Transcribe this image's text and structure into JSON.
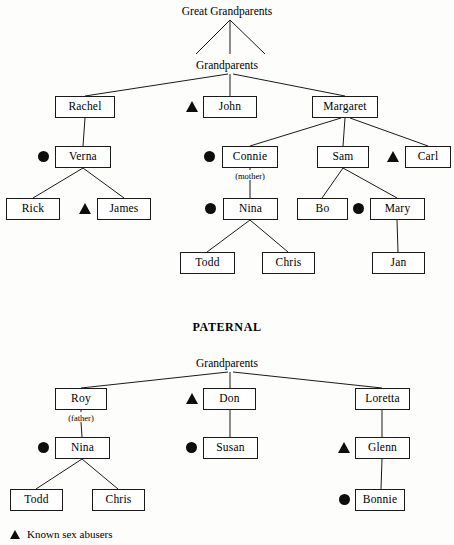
{
  "diagram": {
    "title_maternal": "Great Grandparents",
    "title_maternal_gp": "Grandparents",
    "title_paternal": "PATERNAL",
    "title_paternal_gp": "Grandparents",
    "line_color": "#1a1a1a",
    "marker_color": "#0d0d0d",
    "box_fill": "#ffffff"
  },
  "maternal": {
    "root_label": "Great Grandparents",
    "grandparents_label": "Grandparents",
    "nodes": [
      {
        "id": "rachel",
        "label": "Rachel",
        "x": 55,
        "y": 96,
        "w": 60,
        "h": 22,
        "marker": "none"
      },
      {
        "id": "john",
        "label": "John",
        "x": 203,
        "y": 96,
        "w": 54,
        "h": 22,
        "marker": "triangle"
      },
      {
        "id": "margaret",
        "label": "Margaret",
        "x": 312,
        "y": 96,
        "w": 66,
        "h": 22,
        "marker": "none"
      },
      {
        "id": "verna",
        "label": "Verna",
        "x": 55,
        "y": 146,
        "w": 56,
        "h": 22,
        "marker": "circle"
      },
      {
        "id": "connie",
        "label": "Connie",
        "x": 222,
        "y": 146,
        "w": 56,
        "h": 22,
        "marker": "circle"
      },
      {
        "id": "sam",
        "label": "Sam",
        "x": 317,
        "y": 146,
        "w": 52,
        "h": 22,
        "marker": "none"
      },
      {
        "id": "carl",
        "label": "Carl",
        "x": 405,
        "y": 146,
        "w": 46,
        "h": 22,
        "marker": "triangle"
      },
      {
        "id": "rick",
        "label": "Rick",
        "x": 6,
        "y": 198,
        "w": 54,
        "h": 22,
        "marker": "none"
      },
      {
        "id": "james",
        "label": "James",
        "x": 97,
        "y": 198,
        "w": 54,
        "h": 22,
        "marker": "triangle"
      },
      {
        "id": "nina_m",
        "label": "Nina",
        "x": 223,
        "y": 198,
        "w": 55,
        "h": 22,
        "marker": "circle"
      },
      {
        "id": "bo",
        "label": "Bo",
        "x": 297,
        "y": 198,
        "w": 51,
        "h": 22,
        "marker": "none"
      },
      {
        "id": "mary",
        "label": "Mary",
        "x": 370,
        "y": 198,
        "w": 55,
        "h": 22,
        "marker": "circle"
      },
      {
        "id": "todd_m",
        "label": "Todd",
        "x": 180,
        "y": 252,
        "w": 55,
        "h": 22,
        "marker": "none"
      },
      {
        "id": "chris_m",
        "label": "Chris",
        "x": 262,
        "y": 252,
        "w": 53,
        "h": 22,
        "marker": "none"
      },
      {
        "id": "jan",
        "label": "Jan",
        "x": 372,
        "y": 252,
        "w": 53,
        "h": 22,
        "marker": "none"
      }
    ],
    "sub_labels": [
      {
        "id": "connie-mother",
        "label": "(mother)",
        "x": 250,
        "y": 174
      }
    ]
  },
  "paternal": {
    "section_label": "PATERNAL",
    "grandparents_label": "Grandparents",
    "nodes": [
      {
        "id": "roy",
        "label": "Roy",
        "x": 55,
        "y": 388,
        "w": 52,
        "h": 22,
        "marker": "none"
      },
      {
        "id": "don",
        "label": "Don",
        "x": 203,
        "y": 388,
        "w": 53,
        "h": 22,
        "marker": "triangle"
      },
      {
        "id": "loretta",
        "label": "Loretta",
        "x": 355,
        "y": 388,
        "w": 55,
        "h": 22,
        "marker": "none"
      },
      {
        "id": "nina_p",
        "label": "Nina",
        "x": 55,
        "y": 437,
        "w": 55,
        "h": 22,
        "marker": "circle"
      },
      {
        "id": "susan",
        "label": "Susan",
        "x": 203,
        "y": 437,
        "w": 55,
        "h": 22,
        "marker": "circle"
      },
      {
        "id": "glenn",
        "label": "Glenn",
        "x": 355,
        "y": 437,
        "w": 55,
        "h": 22,
        "marker": "triangle"
      },
      {
        "id": "todd_p",
        "label": "Todd",
        "x": 10,
        "y": 489,
        "w": 53,
        "h": 22,
        "marker": "none"
      },
      {
        "id": "chris_p",
        "label": "Chris",
        "x": 92,
        "y": 489,
        "w": 53,
        "h": 22,
        "marker": "none"
      },
      {
        "id": "bonnie",
        "label": "Bonnie",
        "x": 355,
        "y": 489,
        "w": 50,
        "h": 22,
        "marker": "circle"
      }
    ],
    "sub_labels": [
      {
        "id": "roy-father",
        "label": "(father)",
        "x": 81,
        "y": 416
      }
    ]
  },
  "legend": {
    "items": [
      {
        "glyph": "triangle",
        "label": "Known sex abusers"
      }
    ]
  }
}
